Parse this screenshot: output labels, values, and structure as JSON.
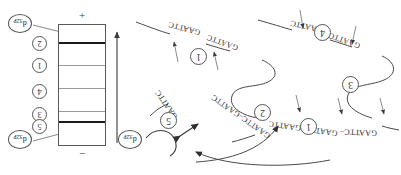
{
  "figure": {
    "type": "gel-electrophoresis-and-restriction-map",
    "title": ""
  },
  "gel": {
    "anode_label": "+",
    "cathode_label": "−",
    "migration_arrow": "migration-direction-arrow",
    "bands": [
      {
        "id": "band-top",
        "label": "2",
        "intensity": "dark",
        "y_pct": 14
      },
      {
        "id": "band-2",
        "label": "1",
        "intensity": "faint",
        "y_pct": 33
      },
      {
        "id": "band-3",
        "label": "4",
        "intensity": "faint",
        "y_pct": 52
      },
      {
        "id": "band-4",
        "label": "3",
        "intensity": "faint",
        "y_pct": 71
      },
      {
        "id": "band-bottom",
        "label": "5",
        "intensity": "dark",
        "y_pct": 79
      }
    ],
    "lane_labels": [
      "2",
      "1",
      "4",
      "3",
      "5"
    ],
    "probe_top_label": "d",
    "probe_top_sub": "32P",
    "probe_bottom_label": "d",
    "probe_bottom_sub": "32P"
  },
  "map": {
    "probe_label": "d",
    "probe_sub": "32P",
    "site_sequence": "GAATTC",
    "fragments": [
      {
        "id": "frag-1",
        "label": "1",
        "sites": [
          "GAATTC",
          "GAATTC"
        ]
      },
      {
        "id": "frag-4",
        "label": "4",
        "sites": [
          "GAATTC",
          "GAATTC"
        ]
      },
      {
        "id": "frag-3",
        "label": "3",
        "sites": []
      },
      {
        "id": "frag-5",
        "label": "5",
        "sites": [
          "GAATTC"
        ]
      },
      {
        "id": "frag-2",
        "label": "2",
        "sites": [
          "GAATTC"
        ]
      },
      {
        "id": "frag-1b",
        "label": "1",
        "sites": [
          "GAATTC"
        ]
      }
    ],
    "sequences": [
      {
        "id": "seq-a",
        "text": "GAATTC"
      },
      {
        "id": "seq-b",
        "text": "GAATTC"
      },
      {
        "id": "seq-c",
        "text": "GAATTC"
      },
      {
        "id": "seq-d",
        "text": "GAATTC"
      },
      {
        "id": "seq-e",
        "text": "GAATTC"
      },
      {
        "id": "seq-f",
        "text": "GAATTC–GAATTC"
      },
      {
        "id": "seq-g",
        "text": "GAATTC–GAATTC"
      },
      {
        "id": "seq-h",
        "text": "GAATTC–"
      }
    ],
    "circled": [
      "1",
      "4",
      "3",
      "5",
      "2",
      "1"
    ]
  },
  "colors": {
    "ink": "#2f2f2f",
    "line": "#4a4a4a",
    "band_dark": "#1a1a1a",
    "band_faint": "#9a9a9a",
    "background": "#ffffff"
  }
}
